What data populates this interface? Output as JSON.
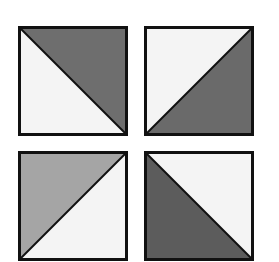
{
  "figure": {
    "colors": {
      "dark": "#6b6b6b",
      "darker": "#5a5a5a",
      "medium": "#a3a3a3",
      "light": "#f4f4f4",
      "stroke": "#111111"
    },
    "tiles": [
      {
        "id": "top-left",
        "x": 18,
        "y": 26,
        "size": 109,
        "diagonal": "tl-br",
        "shaded": "upper-right",
        "shade": "#6e6e6e"
      },
      {
        "id": "top-right",
        "x": 144,
        "y": 26,
        "size": 109,
        "diagonal": "bl-tr",
        "shaded": "lower-right",
        "shade": "#6a6a6a"
      },
      {
        "id": "bottom-left",
        "x": 18,
        "y": 151,
        "size": 109,
        "diagonal": "bl-tr",
        "shaded": "upper-left",
        "shade": "#a5a5a5"
      },
      {
        "id": "bottom-right",
        "x": 144,
        "y": 151,
        "size": 109,
        "diagonal": "tl-br",
        "shaded": "lower-left",
        "shade": "#5c5c5c"
      }
    ]
  }
}
